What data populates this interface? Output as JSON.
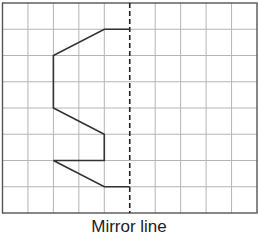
{
  "diagram": {
    "type": "reflection-grid",
    "grid": {
      "columns": 10,
      "rows": 8,
      "left": 2.5,
      "top": 3,
      "cell_width": 25.45,
      "cell_height": 26.25,
      "line_color": "#b5b5b5",
      "border_color": "#555555"
    },
    "mirror_line": {
      "column": 5,
      "style": "dashed",
      "color": "#222222",
      "label": "Mirror line"
    },
    "shape": {
      "color": "#333333",
      "vertices_grid": [
        [
          5,
          1
        ],
        [
          4,
          1
        ],
        [
          2,
          2
        ],
        [
          2,
          4
        ],
        [
          4,
          5
        ],
        [
          4,
          6
        ],
        [
          2,
          6
        ],
        [
          4,
          7
        ],
        [
          5,
          7
        ]
      ]
    }
  }
}
